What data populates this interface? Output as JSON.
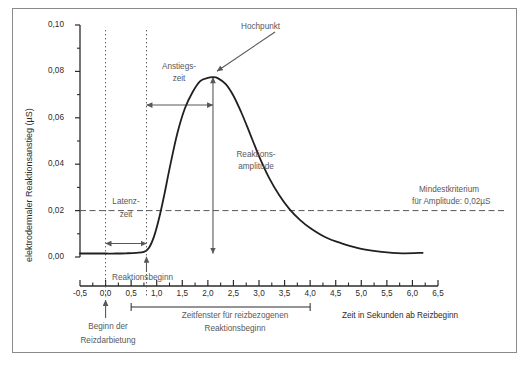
{
  "chart_data": {
    "type": "line",
    "title": "",
    "xlabel": "Zeit in Sekunden ab Reizbeginn",
    "ylabel": "elektrodermaler Reaktionsanstieg (µS)",
    "xlim": [
      -0.5,
      6.5
    ],
    "ylim": [
      0.0,
      0.1
    ],
    "grid": false,
    "x_ticks": [
      "-0,5",
      "0,0",
      "0,5",
      "1,0",
      "1,5",
      "2,0",
      "2,5",
      "3,0",
      "3,5",
      "4,0",
      "4,5",
      "5,0",
      "5,5",
      "6,0",
      "6,5"
    ],
    "x_tick_values": [
      -0.5,
      0.0,
      0.5,
      1.0,
      1.5,
      2.0,
      2.5,
      3.0,
      3.5,
      4.0,
      4.5,
      5.0,
      5.5,
      6.0,
      6.5
    ],
    "y_ticks": [
      "0,00",
      "0,02",
      "0,04",
      "0,06",
      "0,08",
      "0,10"
    ],
    "y_tick_values": [
      0.0,
      0.02,
      0.04,
      0.06,
      0.08,
      0.1
    ],
    "y_minor_tick_values": [
      0.01,
      0.03,
      0.05,
      0.07,
      0.09
    ],
    "series": [
      {
        "name": "elektrodermale Reaktion",
        "color": "#231f20",
        "x": [
          -0.5,
          -0.2,
          0.0,
          0.2,
          0.4,
          0.6,
          0.75,
          0.85,
          0.95,
          1.05,
          1.15,
          1.25,
          1.4,
          1.55,
          1.7,
          1.85,
          2.0,
          2.1,
          2.2,
          2.35,
          2.5,
          2.65,
          2.8,
          3.0,
          3.2,
          3.4,
          3.6,
          3.8,
          4.0,
          4.3,
          4.6,
          5.0,
          5.4,
          5.8,
          6.2
        ],
        "y": [
          0.0015,
          0.0015,
          0.0015,
          0.0015,
          0.0016,
          0.0018,
          0.0022,
          0.004,
          0.009,
          0.017,
          0.027,
          0.038,
          0.053,
          0.064,
          0.071,
          0.0758,
          0.0772,
          0.0775,
          0.077,
          0.0745,
          0.0695,
          0.0625,
          0.0545,
          0.0435,
          0.034,
          0.0265,
          0.0205,
          0.016,
          0.0125,
          0.0085,
          0.006,
          0.0035,
          0.0022,
          0.0016,
          0.0018
        ]
      }
    ],
    "reference_lines": [
      {
        "name": "amplitude-criterion",
        "orientation": "horizontal",
        "value": 0.02,
        "style": "dashed",
        "color": "#58585a"
      },
      {
        "name": "stimulus-onset",
        "orientation": "vertical",
        "value": 0.0,
        "style": "dotted",
        "color": "#58585a"
      },
      {
        "name": "response-onset",
        "orientation": "vertical",
        "value": 0.8,
        "style": "dotted",
        "color": "#58585a"
      }
    ],
    "annotations": [
      {
        "name": "hochpunkt",
        "label": "Hochpunkt",
        "points_to_x": 2.1,
        "points_to_y": 0.0775
      },
      {
        "name": "anstiegszeit",
        "label_line1": "Anstiegs-",
        "label_line2": "zeit",
        "from_x": 0.8,
        "to_x": 2.1,
        "at_y": 0.0655
      },
      {
        "name": "latenzzeit",
        "label_line1": "Latenz-",
        "label_line2": "zeit",
        "from_x": 0.0,
        "to_x": 0.8,
        "at_y": 0.0058
      },
      {
        "name": "reaktionsamplitude",
        "label_line1": "Reaktions-",
        "label_line2": "amplitude",
        "at_x": 2.1,
        "from_y": 0.0015,
        "to_y": 0.0775
      },
      {
        "name": "reaktionsbeginn",
        "label": "Reaktionsbeginn",
        "points_to_x": 0.8,
        "points_to_y": 0.0018
      },
      {
        "name": "mindestkriterium",
        "label_line1": "Mindestkriterium",
        "label_line2": "für Amplitude: 0,02µS",
        "at_y": 0.02
      },
      {
        "name": "beginn-der-reizdarbietung",
        "label_line1": "Beginn der",
        "label_line2": "Reizdarbietung",
        "points_to_x": 0.0
      },
      {
        "name": "zeitfenster",
        "label_line1": "Zeitfenster für reizbezogenen",
        "label_line2": "Reaktionsbeginn",
        "from_x": 0.5,
        "to_x": 4.0
      }
    ]
  },
  "axes": {
    "y_axis_title": "elektrodermaler Reaktionsanstieg (µS)",
    "x_axis_title": "Zeit in Sekunden ab Reizbeginn"
  },
  "labels": {
    "hochpunkt": "Hochpunkt",
    "anstiegszeit_1": "Anstiegs-",
    "anstiegszeit_2": "zeit",
    "latenzzeit_1": "Latenz-",
    "latenzzeit_2": "zeit",
    "reaktionsamplitude_1": "Reaktions-",
    "reaktionsamplitude_2": "amplitude",
    "reaktionsbeginn": "Reaktionsbeginn",
    "mindestkriterium_1": "Mindestkriterium",
    "mindestkriterium_2": "für Amplitude: 0,02µS",
    "beginn_1": "Beginn der",
    "beginn_2": "Reizdarbietung",
    "zeitfenster_1": "Zeitfenster für reizbezogenen",
    "zeitfenster_2": "Reaktionsbeginn"
  },
  "ticks": {
    "x": [
      "-0,5",
      "0,0",
      "0,5",
      "1,0",
      "1,5",
      "2,0",
      "2,5",
      "3,0",
      "3,5",
      "4,0",
      "4,5",
      "5,0",
      "5,5",
      "6,0",
      "6,5"
    ],
    "y": [
      "0,00",
      "0,02",
      "0,04",
      "0,06",
      "0,08",
      "0,10"
    ]
  },
  "colors": {
    "curve": "#231f20",
    "annotation": "#58585a",
    "axis": "#2b2b2b",
    "frame": "#8a8a8a"
  }
}
